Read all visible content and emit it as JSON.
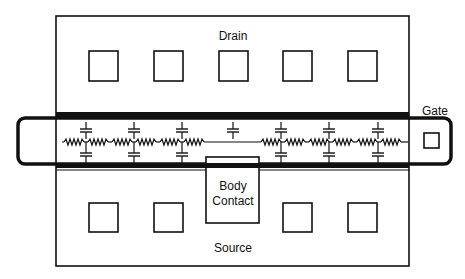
{
  "diagram": {
    "type": "MOSFET layout with distributed gate RC network",
    "labels": {
      "drain": "Drain",
      "source": "Source",
      "gate": "Gate",
      "body_contact_line1": "Body",
      "body_contact_line2": "Contact"
    },
    "regions": [
      {
        "name": "drain",
        "contacts": 5
      },
      {
        "name": "gate-stripe",
        "rc_stages_left": 3,
        "rc_stages_right": 3,
        "center_capacitor": 1
      },
      {
        "name": "source",
        "contacts": 4
      },
      {
        "name": "body-contact",
        "contacts": 1
      },
      {
        "name": "gate-pad",
        "contacts": 1
      }
    ],
    "colors": {
      "line": "#111111",
      "background": "#ffffff"
    }
  }
}
